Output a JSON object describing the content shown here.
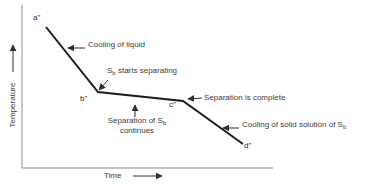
{
  "figure": {
    "y_axis": {
      "label": "Temperature"
    },
    "x_axis": {
      "label": "Time"
    },
    "points": {
      "a": "a\"",
      "b": "b\"",
      "c": "c\"",
      "d": "d\""
    },
    "annotations": {
      "cooling_liquid": "Cooling of liquid",
      "sb_starts": {
        "pre": "S",
        "sub": "b",
        "post": " starts separating"
      },
      "separation_complete": "Separation is complete",
      "separation_continues": {
        "line1_pre": "Separation of S",
        "line1_sub": "b",
        "line2": "continues"
      },
      "cooling_solid": {
        "pre": "Cooling of solid solution of S",
        "sub": "b"
      }
    },
    "curve": {
      "points": "46,27 98,92 183,101 243,144"
    },
    "colors": {
      "curve": "#1c1c1c",
      "axis": "#8c8c8c",
      "arrow": "#2e2e2e"
    }
  }
}
